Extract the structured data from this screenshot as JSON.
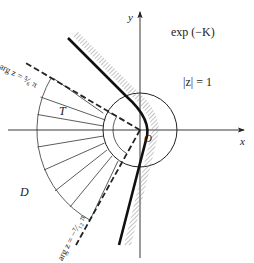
{
  "figure": {
    "labels": {
      "x_axis": "x",
      "y_axis": "y",
      "origin": "O",
      "curve_label": "exp (−K)",
      "circle_label": "|z| = 1",
      "region_T": "T",
      "region_D": "D",
      "ray_upper": "arg z = ⁵⁄₆ π",
      "ray_lower": "arg z = −⁷⁄₁₂ π"
    },
    "colors": {
      "ink": "#222222",
      "hatch": "#888888",
      "background": "#ffffff"
    },
    "geometry": {
      "origin_px": [
        140,
        130
      ],
      "unit_circle_radius_px": 37,
      "sector_outer_radius_px": 103,
      "sector_inner_radius_px": 27,
      "fan_line_count": 9
    }
  }
}
